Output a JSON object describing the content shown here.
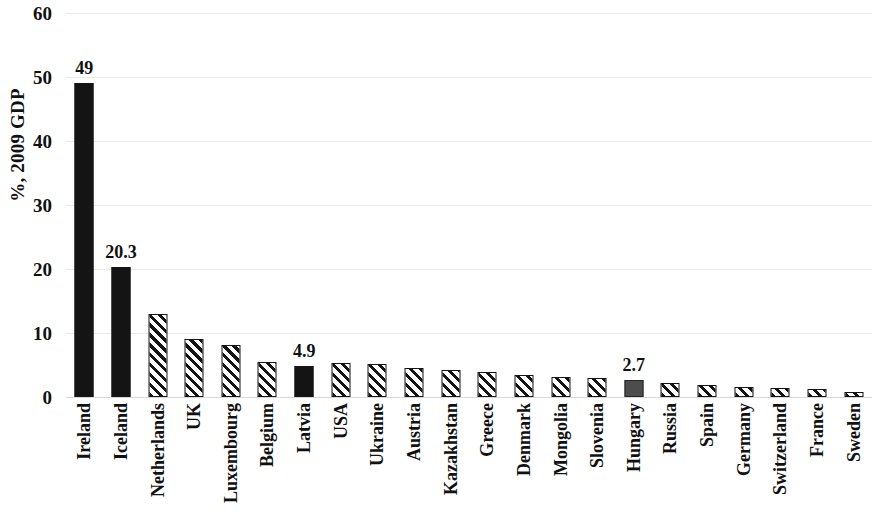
{
  "chart_data": {
    "type": "bar",
    "title": "",
    "subtitle": "",
    "xlabel": "",
    "ylabel": "%, 2009 GDP",
    "ylim": [
      0,
      60
    ],
    "y_ticks": [
      0,
      10,
      20,
      30,
      40,
      50,
      60
    ],
    "y_tick_labels": [
      "0",
      "10",
      "20",
      "30",
      "40",
      "50",
      "60"
    ],
    "grid": true,
    "legend": "none",
    "categories": [
      "Ireland",
      "Iceland",
      "Netherlands",
      "UK",
      "Luxembourg",
      "Belgium",
      "Latvia",
      "USA",
      "Ukraine",
      "Austria",
      "Kazakhstan",
      "Greece",
      "Denmark",
      "Mongolia",
      "Slovenia",
      "Hungary",
      "Russia",
      "Spain",
      "Germany",
      "Switzerland",
      "France",
      "Sweden"
    ],
    "values": [
      49,
      20.3,
      12.9,
      9.1,
      8.1,
      5.4,
      4.9,
      5.3,
      5.1,
      4.5,
      4.2,
      3.9,
      3.5,
      3.2,
      3.0,
      2.7,
      2.2,
      1.9,
      1.6,
      1.4,
      1.2,
      0.8
    ],
    "bar_styles": [
      "solid-black",
      "solid-black",
      "hatch",
      "hatch",
      "hatch",
      "hatch",
      "solid-black",
      "hatch",
      "hatch",
      "hatch",
      "hatch",
      "hatch",
      "hatch",
      "hatch",
      "hatch",
      "solid-gray",
      "hatch",
      "hatch",
      "hatch",
      "hatch",
      "hatch",
      "hatch"
    ],
    "data_labels": [
      "49",
      "20.3",
      null,
      null,
      null,
      null,
      "4.9",
      null,
      null,
      null,
      null,
      null,
      null,
      null,
      null,
      "2.7",
      null,
      null,
      null,
      null,
      null,
      null
    ],
    "colors": {
      "solid_black": "#141414",
      "solid_gray": "#4d4d4d",
      "hatch_line": "#141414",
      "hatch_background": "#ffffff",
      "gridline": "#e9e9e9",
      "text": "#111111",
      "plot_background": "#ffffff"
    }
  }
}
